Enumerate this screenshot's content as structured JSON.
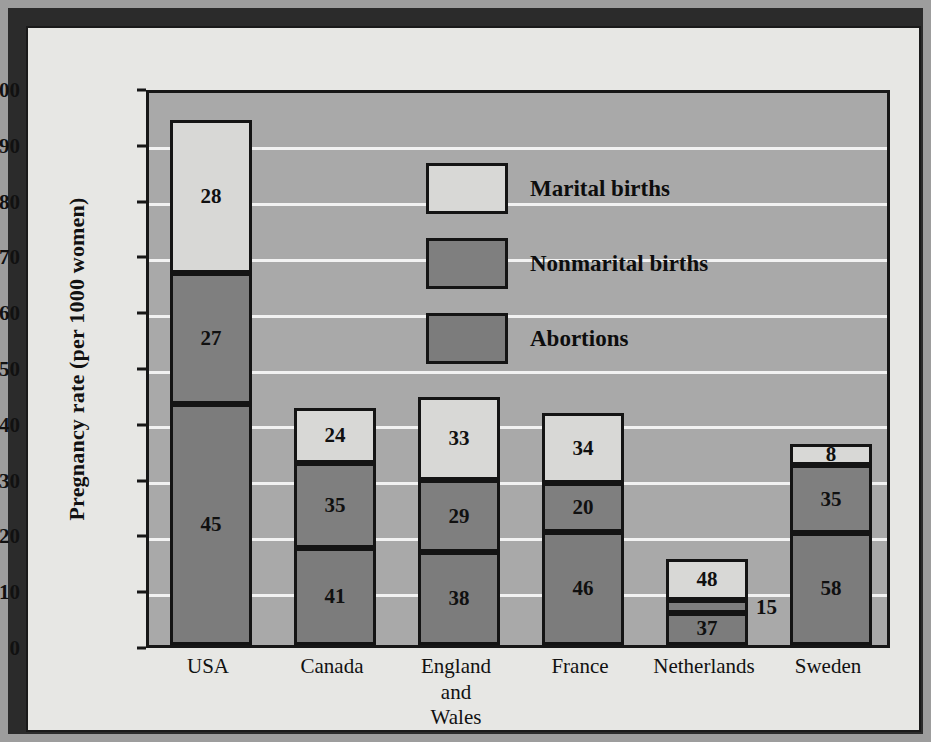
{
  "chart_data": {
    "type": "bar",
    "subtype": "stacked",
    "title": "",
    "xlabel": "",
    "ylabel": "Pregnancy rate (per 1000 women)",
    "ylim": [
      0,
      100
    ],
    "yticks": [
      0,
      10,
      20,
      30,
      40,
      50,
      60,
      70,
      80,
      90,
      100
    ],
    "grid": true,
    "legend_position": "inside-top-center",
    "categories": [
      "USA",
      "Canada",
      "England and Wales",
      "France",
      "Netherlands",
      "Sweden"
    ],
    "category_lines": [
      [
        "USA"
      ],
      [
        "Canada"
      ],
      [
        "England",
        "and",
        "Wales"
      ],
      [
        "France"
      ],
      [
        "Netherlands"
      ],
      [
        "Sweden"
      ]
    ],
    "series": [
      {
        "name": "Abortions",
        "key": "abortions",
        "color": "#7c7c7c",
        "values": [
          43.2,
          17.3,
          16.7,
          20.2,
          5.8,
          20.1
        ],
        "labels": [
          "45",
          "41",
          "38",
          "46",
          "37",
          "58"
        ]
      },
      {
        "name": "Nonmarital births",
        "key": "nonmarital",
        "color": "#7f7f7f",
        "values": [
          23.4,
          15.3,
          12.8,
          8.8,
          2.3,
          12.1
        ],
        "labels": [
          "27",
          "35",
          "29",
          "20",
          "15",
          "35"
        ]
      },
      {
        "name": "Marital births",
        "key": "marital",
        "color": "#d8d8d6",
        "values": [
          27.4,
          9.9,
          14.9,
          12.6,
          7.4,
          3.8
        ],
        "labels": [
          "28",
          "24",
          "33",
          "34",
          "48",
          "8"
        ]
      }
    ],
    "totals": [
      94.0,
      42.5,
      44.4,
      41.6,
      15.5,
      36.0
    ],
    "label_note": "Segment labels are percentages of each country's total pregnancy rate",
    "outside_labels": [
      {
        "category": "Netherlands",
        "series": "Nonmarital births",
        "text": "15"
      }
    ]
  },
  "legend": {
    "items": [
      {
        "label": "Marital births",
        "key": "marital"
      },
      {
        "label": "Nonmarital births",
        "key": "nonmarital"
      },
      {
        "label": "Abortions",
        "key": "abortions"
      }
    ]
  },
  "colors": {
    "plot_background": "#a9a9a9",
    "paper": "#e7e7e4",
    "frame": "#2b2b2b",
    "gridline": "#f2f2f2",
    "axis": "#171717",
    "marital": "#d8d8d6",
    "nonmarital": "#7f7f7f",
    "abortions": "#7c7c7c"
  }
}
